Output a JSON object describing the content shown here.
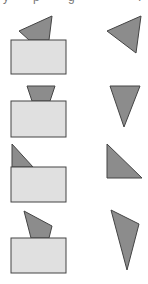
{
  "figure": {
    "colors": {
      "background": "#ffffff",
      "rect_fill": "#e0e0e0",
      "shape_fill": "#8c8c8c",
      "stroke": "#444444"
    },
    "top_text_fragments": [
      {
        "x": 3,
        "text": "y"
      },
      {
        "x": 33,
        "text": "p"
      },
      {
        "x": 68,
        "text": "g"
      },
      {
        "x": 138,
        "text": "."
      }
    ],
    "rows": [
      {
        "rect": {
          "x": 11,
          "y": 40,
          "w": 55,
          "h": 34
        },
        "composite_shape": "19,31 52,16 49,40 29,40",
        "isolated_shape": "107,31 141,16 136,53"
      },
      {
        "rect": {
          "x": 11,
          "y": 101,
          "w": 55,
          "h": 36
        },
        "composite_shape": "27,86 55,86 50,101 32,101",
        "isolated_shape": "110,86 140,86 124,127"
      },
      {
        "rect": {
          "x": 11,
          "y": 167,
          "w": 55,
          "h": 35
        },
        "composite_shape": "12,144 33,167 12,167",
        "isolated_shape": "107,144 142,178 107,178"
      },
      {
        "rect": {
          "x": 11,
          "y": 238,
          "w": 55,
          "h": 35
        },
        "composite_shape": "24,211 52,226 49,238 31,238",
        "isolated_shape": "111,210 139,224 127,270"
      }
    ]
  }
}
